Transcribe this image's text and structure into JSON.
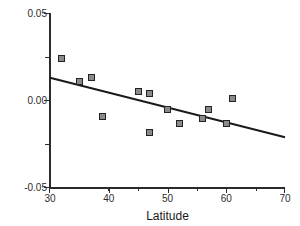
{
  "chart_data": {
    "type": "scatter",
    "title": "",
    "xlabel": "Latitude",
    "ylabel": "Sexual size dimorphism",
    "xlim": [
      30,
      70
    ],
    "ylim": [
      -0.05,
      0.05
    ],
    "xticks": [
      30,
      40,
      50,
      60,
      70
    ],
    "xticklabels": [
      "30",
      "40",
      "50",
      "60",
      "70"
    ],
    "xminorticks": [
      35,
      45,
      55,
      65
    ],
    "yticks": [
      -0.05,
      0.0,
      0.05
    ],
    "yticklabels": [
      "-0.05",
      "0.00",
      "0.05"
    ],
    "yminorticks": [
      -0.025,
      0.025
    ],
    "grid": false,
    "legend": false,
    "marker": "filled-square",
    "marker_face_color": "#8a8a8a",
    "marker_edge_color": "#232323",
    "line_color": "#1a1a1a",
    "axis_color": "#2b2b2b",
    "background": "#ffffff",
    "x": [
      32,
      35,
      37,
      39,
      45,
      47,
      47,
      50,
      52,
      56,
      57,
      60,
      61
    ],
    "y": [
      0.024,
      0.011,
      0.013,
      -0.009,
      0.005,
      0.004,
      -0.018,
      -0.005,
      -0.013,
      -0.01,
      -0.005,
      -0.013,
      0.001
    ],
    "points": [
      {
        "x": 32,
        "y": 0.024
      },
      {
        "x": 35,
        "y": 0.011
      },
      {
        "x": 37,
        "y": 0.013
      },
      {
        "x": 39,
        "y": -0.009
      },
      {
        "x": 45,
        "y": 0.005
      },
      {
        "x": 47,
        "y": 0.004
      },
      {
        "x": 47,
        "y": -0.018
      },
      {
        "x": 50,
        "y": -0.005
      },
      {
        "x": 52,
        "y": -0.013
      },
      {
        "x": 56,
        "y": -0.01
      },
      {
        "x": 57,
        "y": -0.005
      },
      {
        "x": 60,
        "y": -0.013
      },
      {
        "x": 61,
        "y": 0.001
      }
    ],
    "trendline": {
      "type": "linear-regression",
      "x_start": 30,
      "y_start": 0.013,
      "x_end": 70,
      "y_end": -0.021
    }
  },
  "axes": {
    "x_title": "Latitude",
    "y_title": "Sexual size dimorphism",
    "x_tick_labels": [
      "30",
      "40",
      "50",
      "60",
      "70"
    ],
    "y_tick_labels": [
      "0.05",
      "0.00",
      "-0.05"
    ]
  }
}
